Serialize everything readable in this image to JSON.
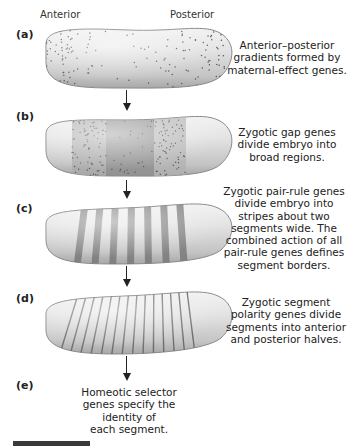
{
  "figure": {
    "axis": {
      "left": "Anterior",
      "right": "Posterior"
    },
    "panels": [
      {
        "id": "a",
        "label": "(a)",
        "caption": [
          "Anterior–posterior",
          "gradients formed by",
          "maternal-effect genes."
        ],
        "pattern": "dotted-gradient"
      },
      {
        "id": "b",
        "label": "(b)",
        "caption": [
          "Zygotic gap genes",
          "divide embryo into",
          "broad regions."
        ],
        "pattern": "broad-regions"
      },
      {
        "id": "c",
        "label": "(c)",
        "caption": [
          "Zygotic pair-rule genes",
          "divide embryo into",
          "stripes about two",
          "segments wide. The",
          "combined action of all",
          "pair-rule genes defines",
          "segment borders."
        ],
        "pattern": "seven-stripes"
      },
      {
        "id": "d",
        "label": "(d)",
        "caption": [
          "Zygotic segment",
          "polarity genes divide",
          "segments into anterior",
          "and posterior halves."
        ],
        "pattern": "fourteen-thin-stripes"
      },
      {
        "id": "e",
        "label": "(e)",
        "caption": [
          "Homeotic selector",
          "genes specify the",
          "identity of",
          "each segment."
        ],
        "pattern": "none"
      }
    ],
    "colors": {
      "embryo_fill": "#d6d6d6",
      "embryo_edge": "#8a8a8a",
      "dots": "#555555",
      "region_dark": "#8c8c8c",
      "region_mid": "#a8a8a8",
      "stripe": "#7a7a7a",
      "thin_stripe": "#6e6e6e",
      "arrow": "#222222",
      "footer_bar": "#3a3a3a"
    }
  }
}
